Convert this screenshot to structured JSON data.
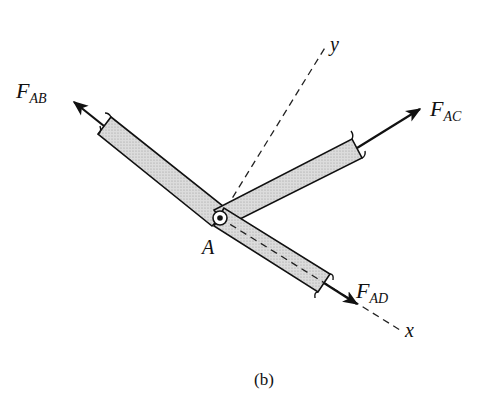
{
  "figure": {
    "caption": "(b)",
    "joint_label": "A",
    "axes": {
      "x_label": "x",
      "y_label": "y"
    },
    "forces": [
      {
        "id": "AB",
        "symbol": "F",
        "subscript": "AB"
      },
      {
        "id": "AC",
        "symbol": "F",
        "subscript": "AC"
      },
      {
        "id": "AD",
        "symbol": "F",
        "subscript": "AD"
      }
    ],
    "colors": {
      "member_fill": "#d4d4d4",
      "stroke": "#111111",
      "background": "#ffffff"
    }
  }
}
